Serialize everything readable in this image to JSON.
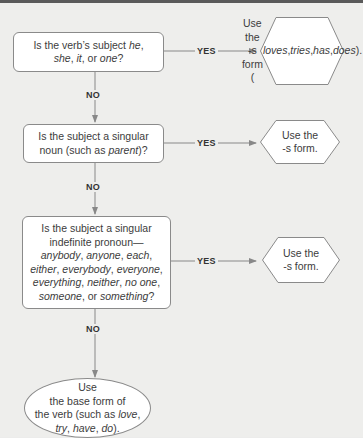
{
  "diagram": {
    "type": "flowchart",
    "header_bar_color": "#5a5a5a",
    "questions": [
      {
        "id": "q1",
        "parts": [
          {
            "text": "Is the verb’s subject ",
            "italic": false
          },
          {
            "text": "he",
            "italic": true
          },
          {
            "text": ",",
            "italic": false
          },
          {
            "br": true
          },
          {
            "text": "she",
            "italic": true
          },
          {
            "text": ", ",
            "italic": false
          },
          {
            "text": "it",
            "italic": true
          },
          {
            "text": ", or ",
            "italic": false
          },
          {
            "text": "one",
            "italic": true
          },
          {
            "text": "?",
            "italic": false
          }
        ]
      },
      {
        "id": "q2",
        "parts": [
          {
            "text": "Is the subject a singular",
            "italic": false
          },
          {
            "br": true
          },
          {
            "text": "noun (such as ",
            "italic": false
          },
          {
            "text": "parent",
            "italic": true
          },
          {
            "text": ")?",
            "italic": false
          }
        ]
      },
      {
        "id": "q3",
        "parts": [
          {
            "text": "Is the subject a singular",
            "italic": false
          },
          {
            "br": true
          },
          {
            "text": "indefinite pronoun—",
            "italic": false
          },
          {
            "br": true
          },
          {
            "text": "anybody",
            "italic": true
          },
          {
            "text": ", ",
            "italic": false
          },
          {
            "text": "anyone",
            "italic": true
          },
          {
            "text": ", ",
            "italic": false
          },
          {
            "text": "each",
            "italic": true
          },
          {
            "text": ",",
            "italic": false
          },
          {
            "br": true
          },
          {
            "text": "either",
            "italic": true
          },
          {
            "text": ", ",
            "italic": false
          },
          {
            "text": "everybody",
            "italic": true
          },
          {
            "text": ", ",
            "italic": false
          },
          {
            "text": "everyone",
            "italic": true
          },
          {
            "text": ",",
            "italic": false
          },
          {
            "br": true
          },
          {
            "text": "everything",
            "italic": true
          },
          {
            "text": ", ",
            "italic": false
          },
          {
            "text": "neither",
            "italic": true
          },
          {
            "text": ", ",
            "italic": false
          },
          {
            "text": "no one",
            "italic": true
          },
          {
            "text": ",",
            "italic": false
          },
          {
            "br": true
          },
          {
            "text": "someone",
            "italic": true
          },
          {
            "text": ", or ",
            "italic": false
          },
          {
            "text": "something",
            "italic": true
          },
          {
            "text": "?",
            "italic": false
          }
        ]
      }
    ],
    "outcomes": [
      {
        "id": "o1",
        "parts": [
          {
            "text": "Use the",
            "italic": false
          },
          {
            "br": true
          },
          {
            "text": "-s form",
            "italic": false
          },
          {
            "br": true
          },
          {
            "text": "(",
            "italic": false
          },
          {
            "text": "loves",
            "italic": true
          },
          {
            "text": ", ",
            "italic": false
          },
          {
            "text": "tries",
            "italic": true
          },
          {
            "text": ",",
            "italic": false
          },
          {
            "br": true
          },
          {
            "text": "has",
            "italic": true
          },
          {
            "text": ", ",
            "italic": false
          },
          {
            "text": "does",
            "italic": true
          },
          {
            "text": ").",
            "italic": false
          }
        ]
      },
      {
        "id": "o2",
        "parts": [
          {
            "text": "Use the",
            "italic": false
          },
          {
            "br": true
          },
          {
            "text": "-s form.",
            "italic": false
          }
        ]
      },
      {
        "id": "o3",
        "parts": [
          {
            "text": "Use the",
            "italic": false
          },
          {
            "br": true
          },
          {
            "text": "-s form.",
            "italic": false
          }
        ]
      }
    ],
    "final": {
      "id": "final",
      "parts": [
        {
          "text": "Use",
          "italic": false
        },
        {
          "br": true
        },
        {
          "text": "the base form of",
          "italic": false
        },
        {
          "br": true
        },
        {
          "text": "the verb (such as ",
          "italic": false
        },
        {
          "text": "love",
          "italic": true
        },
        {
          "text": ",",
          "italic": false
        },
        {
          "br": true
        },
        {
          "text": "try",
          "italic": true
        },
        {
          "text": ", ",
          "italic": false
        },
        {
          "text": "have",
          "italic": true
        },
        {
          "text": ", ",
          "italic": false
        },
        {
          "text": "do",
          "italic": true
        },
        {
          "text": ").",
          "italic": false
        }
      ]
    },
    "labels": {
      "yes": "YES",
      "no": "NO"
    }
  }
}
